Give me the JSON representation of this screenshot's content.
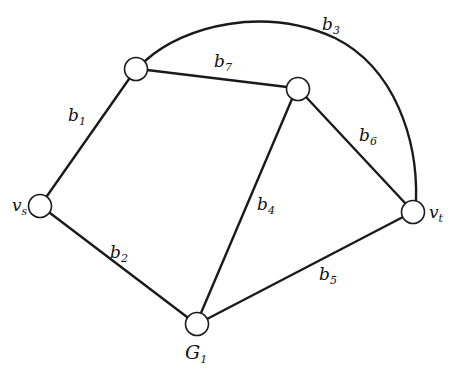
{
  "diagram": {
    "type": "graph",
    "title": "",
    "nodes": [
      {
        "id": "n_tl",
        "label": "",
        "x": 136,
        "y": 69
      },
      {
        "id": "n_tr",
        "label": "",
        "x": 298,
        "y": 89
      },
      {
        "id": "vs",
        "label": "v",
        "sub": "s",
        "x": 40,
        "y": 206
      },
      {
        "id": "G1",
        "label": "G",
        "sub": "1",
        "x": 197,
        "y": 324
      },
      {
        "id": "vt",
        "label": "v",
        "sub": "t",
        "x": 413,
        "y": 212
      }
    ],
    "edges": [
      {
        "id": "b1",
        "label": "b",
        "sub": "1",
        "from": "vs",
        "to": "n_tl"
      },
      {
        "id": "b2",
        "label": "b",
        "sub": "2",
        "from": "vs",
        "to": "G1"
      },
      {
        "id": "b3",
        "label": "b",
        "sub": "3",
        "from": "n_tl",
        "to": "vt",
        "curved": true
      },
      {
        "id": "b4",
        "label": "b",
        "sub": "4",
        "from": "G1",
        "to": "n_tr"
      },
      {
        "id": "b5",
        "label": "b",
        "sub": "5",
        "from": "G1",
        "to": "vt"
      },
      {
        "id": "b6",
        "label": "b",
        "sub": "6",
        "from": "n_tr",
        "to": "vt"
      },
      {
        "id": "b7",
        "label": "b",
        "sub": "7",
        "from": "n_tl",
        "to": "n_tr"
      }
    ]
  },
  "labels": {
    "b1": {
      "main": "b",
      "sub": "1"
    },
    "b2": {
      "main": "b",
      "sub": "2"
    },
    "b3": {
      "main": "b",
      "sub": "3"
    },
    "b4": {
      "main": "b",
      "sub": "4"
    },
    "b5": {
      "main": "b",
      "sub": "5"
    },
    "b6": {
      "main": "b",
      "sub": "6"
    },
    "b7": {
      "main": "b",
      "sub": "7"
    },
    "vs": {
      "main": "v",
      "sub": "s"
    },
    "vt": {
      "main": "v",
      "sub": "t"
    },
    "G1": {
      "main": "G",
      "sub": "1"
    }
  }
}
